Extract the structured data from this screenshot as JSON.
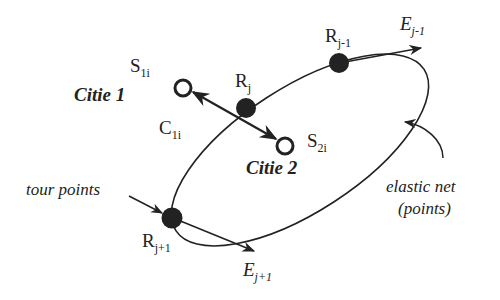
{
  "diagram": {
    "type": "elastic-net-tsp",
    "colors": {
      "stroke": "#222222",
      "node_fill": "#222222",
      "city_fill": "#ffffff",
      "background": "#ffffff"
    },
    "cities": [
      {
        "name": "Citie 1",
        "symbol": "S",
        "subscript": "1i"
      },
      {
        "name": "Citie 2",
        "symbol": "S",
        "subscript": "2i"
      }
    ],
    "connection": {
      "symbol": "C",
      "subscript": "1i"
    },
    "tour_points": [
      {
        "symbol": "R",
        "subscript": "j-1"
      },
      {
        "symbol": "R",
        "subscript": "j"
      },
      {
        "symbol": "R",
        "subscript": "j+1"
      }
    ],
    "forces": [
      {
        "symbol": "E",
        "subscript": "j-1"
      },
      {
        "symbol": "E",
        "subscript": "j+1"
      }
    ],
    "annotations": {
      "tour_points": "tour points",
      "elastic_net_line1": "elastic net",
      "elastic_net_line2": "(points)"
    }
  }
}
